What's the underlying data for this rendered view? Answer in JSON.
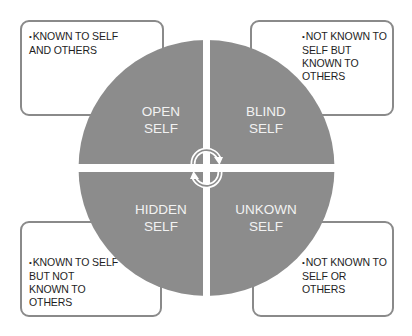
{
  "diagram": {
    "colors": {
      "quadrant_fill": "#8c8c8c",
      "quadrant_text": "#f2f2f2",
      "box_border": "#8a8a8a",
      "box_text": "#1e1e1e",
      "background": "#ffffff",
      "cycle_arrows": "#ffffff"
    },
    "quadrants": [
      {
        "id": "open",
        "label": "OPEN\nSELF",
        "position": "top-left"
      },
      {
        "id": "blind",
        "label": "BLIND\nSELF",
        "position": "top-right"
      },
      {
        "id": "hidden",
        "label": "HIDDEN\nSELF",
        "position": "bottom-left"
      },
      {
        "id": "unknown",
        "label": "UNKOWN\nSELF",
        "position": "bottom-right"
      }
    ],
    "notes": [
      {
        "for": "open",
        "bullet": "•",
        "text": "KNOWN TO SELF\nAND OTHERS"
      },
      {
        "for": "blind",
        "bullet": "•",
        "text": "NOT KNOWN TO\nSELF BUT\nKNOWN TO\nOTHERS"
      },
      {
        "for": "hidden",
        "bullet": "•",
        "text": "KNOWN TO SELF\nBUT NOT\nKNOWN TO\nOTHERS"
      },
      {
        "for": "unknown",
        "bullet": "•",
        "text": "NOT KNOWN TO\nSELF OR OTHERS"
      }
    ],
    "center_icon": "cycle-arrows-icon"
  }
}
